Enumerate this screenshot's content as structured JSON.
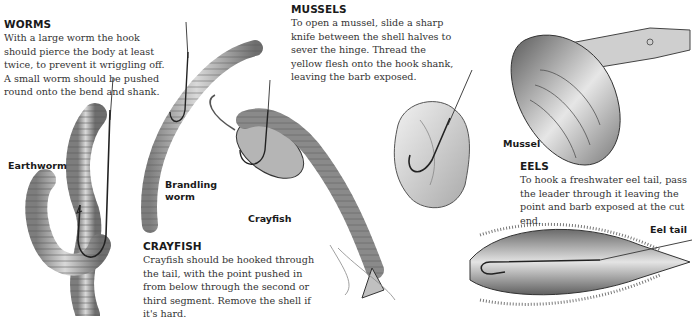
{
  "sections": {
    "worms": {
      "heading": "WORMS",
      "body": "With a large worm the hook should pierce the body at least twice, to prevent it wriggling off. A small worm should be pushed round onto the bend and shank."
    },
    "mussels": {
      "heading": "MUSSELS",
      "body": "To open a mussel, slide a sharp knife between the shell halves to sever the hinge. Thread the yellow flesh onto the hook shank, leaving the barb exposed."
    },
    "eels": {
      "heading": "EELS",
      "body": "To hook a freshwater eel tail, pass the leader through it leaving the point and barb exposed at the cut end."
    },
    "crayfish": {
      "heading": "CRAYFISH",
      "body": "Crayfish should be hooked through the tail, with the point pushed in from below through the second or third segment. Remove the shell if it's hard."
    }
  },
  "labels": {
    "earthworm": "Earthworm",
    "brandling_line1": "Brandling",
    "brandling_line2": "worm",
    "crayfish": "Crayfish",
    "mussel": "Mussel",
    "eel_tail": "Eel tail"
  },
  "illustrations": [
    {
      "name": "earthworm-on-hook"
    },
    {
      "name": "brandling-worm-on-hook"
    },
    {
      "name": "crayfish-on-hook"
    },
    {
      "name": "mussel-flesh-on-hook"
    },
    {
      "name": "mussel-shell-with-knife"
    },
    {
      "name": "eel-tail-on-hook"
    }
  ]
}
